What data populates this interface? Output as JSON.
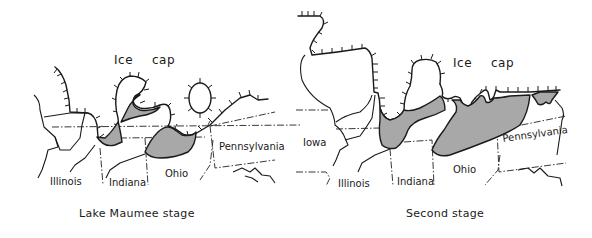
{
  "panels": [
    {
      "id": "lake-maumee",
      "caption": "Lake Maumee stage",
      "ice_label_1": "Ice",
      "ice_label_2": "cap",
      "states": [
        "Illinois",
        "Indiana",
        "Ohio",
        "Pennsylvania"
      ]
    },
    {
      "id": "second-stage",
      "caption": "Second stage",
      "ice_label_1": "Ice",
      "ice_label_2": "cap",
      "states": [
        "Iowa",
        "Illinois",
        "Indiana",
        "Ohio",
        "Pennsylvania"
      ]
    }
  ],
  "colors": {
    "lake_fill": "#a8a8a8",
    "line": "#1a1a1a",
    "background": "#ffffff"
  }
}
